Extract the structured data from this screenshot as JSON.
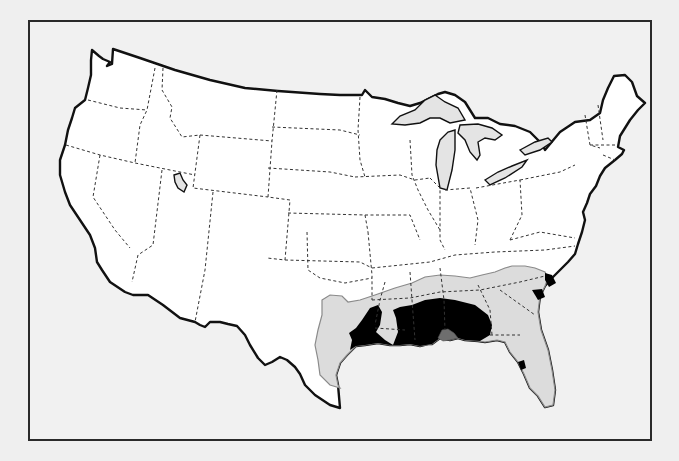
{
  "map": {
    "subject": "Contiguous United States",
    "frame": {
      "x": 28,
      "y": 20,
      "width": 624,
      "height": 421
    },
    "colors": {
      "background": "#efefef",
      "land": "#ffffff",
      "outline": "#111111",
      "state_border": "#333333",
      "lakes": "#e4e4e4",
      "zone_light": "#dcdcdc",
      "zone_medium": "#a9a9a9",
      "zone_dark": "#6e6e6e"
    },
    "shaded_regions": [
      {
        "level": "light",
        "area": "Southeastern US from east Texas to North Carolina and Florida"
      },
      {
        "level": "medium",
        "area": "Louisiana, Mississippi, Alabama, Gulf Coast interior; small patches on Carolina and Florida coasts"
      },
      {
        "level": "dark",
        "area": "Coastal Mississippi/Alabama near Mobile Bay"
      }
    ],
    "labels": []
  }
}
